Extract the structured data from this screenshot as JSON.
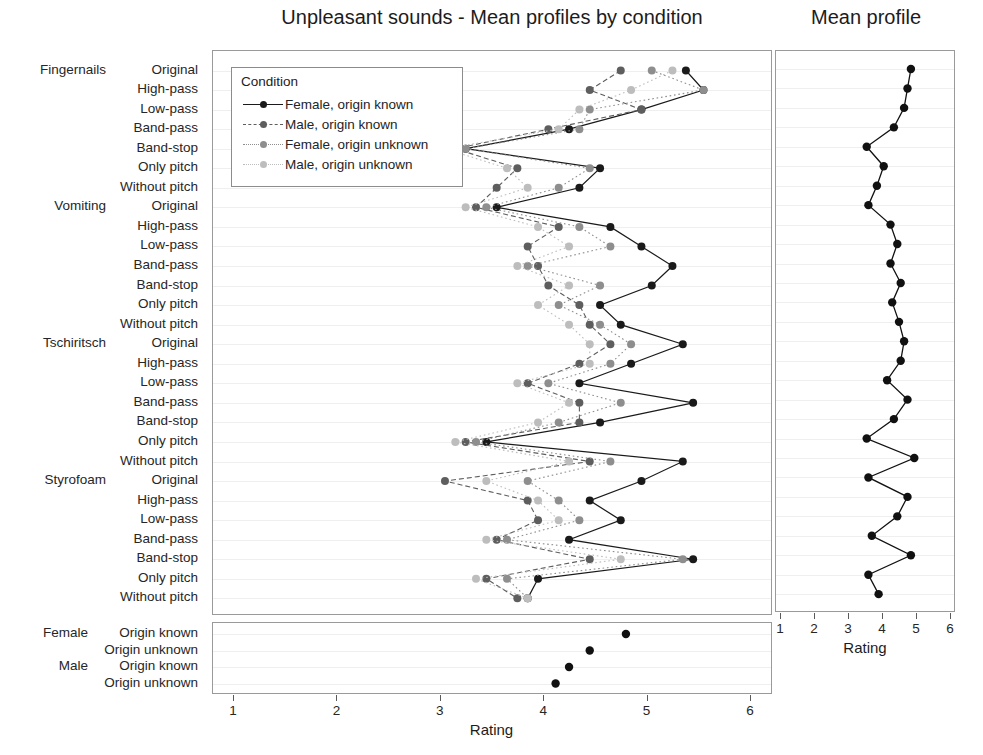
{
  "titles": {
    "main": "Unpleasant sounds - Mean profiles by condition",
    "right": "Mean profile"
  },
  "legend": {
    "title": "Condition",
    "entries": [
      {
        "label": "Female, origin known",
        "color": "#1a1a1a",
        "dash": "solid"
      },
      {
        "label": "Male, origin known",
        "color": "#5e5e5e",
        "dash": "dashed"
      },
      {
        "label": "Female, origin unknown",
        "color": "#8e8e8e",
        "dash": "dotted"
      },
      {
        "label": "Male, origin unknown",
        "color": "#bdbdbd",
        "dash": "dotted"
      }
    ]
  },
  "axis": {
    "xlabel": "Rating",
    "ticks": [
      1,
      2,
      3,
      4,
      5,
      6
    ],
    "xlim": [
      1,
      6
    ]
  },
  "groups": [
    "Fingernails",
    "Vomiting",
    "Tschiritsch",
    "Styrofoam"
  ],
  "filters": [
    "Original",
    "High-pass",
    "Low-pass",
    "Band-pass",
    "Band-stop",
    "Only pitch",
    "Without pitch"
  ],
  "bottom_groups": [
    "Female",
    "Male"
  ],
  "bottom_levels": [
    "Origin known",
    "Origin unknown",
    "Origin known",
    "Origin unknown"
  ],
  "chart_data": {
    "type": "line",
    "title": "Unpleasant sounds - Mean profiles by condition",
    "xlabel": "Rating",
    "ylabel": "",
    "xlim": [
      1,
      6
    ],
    "grid": true,
    "legend_position": "top-left-inside",
    "orientation": "horizontal",
    "categories": [
      "Fingernails / Original",
      "Fingernails / High-pass",
      "Fingernails / Low-pass",
      "Fingernails / Band-pass",
      "Fingernails / Band-stop",
      "Fingernails / Only pitch",
      "Fingernails / Without pitch",
      "Vomiting / Original",
      "Vomiting / High-pass",
      "Vomiting / Low-pass",
      "Vomiting / Band-pass",
      "Vomiting / Band-stop",
      "Vomiting / Only pitch",
      "Vomiting / Without pitch",
      "Tschiritsch / Original",
      "Tschiritsch / High-pass",
      "Tschiritsch / Low-pass",
      "Tschiritsch / Band-pass",
      "Tschiritsch / Band-stop",
      "Tschiritsch / Only pitch",
      "Tschiritsch / Without pitch",
      "Styrofoam / Original",
      "Styrofoam / High-pass",
      "Styrofoam / Low-pass",
      "Styrofoam / Band-pass",
      "Styrofoam / Band-stop",
      "Styrofoam / Only pitch",
      "Styrofoam / Without pitch"
    ],
    "series": [
      {
        "name": "Female, origin known",
        "color": "#1a1a1a",
        "dash": "solid",
        "values": [
          5.38,
          5.55,
          4.95,
          4.25,
          3.25,
          4.55,
          4.35,
          3.55,
          4.65,
          4.95,
          5.25,
          5.05,
          4.55,
          4.75,
          5.35,
          4.85,
          4.35,
          5.45,
          4.55,
          3.45,
          5.35,
          4.95,
          4.45,
          4.75,
          4.25,
          5.45,
          3.95,
          3.85
        ]
      },
      {
        "name": "Male, origin known",
        "color": "#5e5e5e",
        "dash": "dashed",
        "values": [
          4.75,
          4.45,
          4.95,
          4.05,
          3.15,
          3.75,
          3.55,
          3.35,
          4.15,
          3.85,
          3.95,
          4.05,
          4.35,
          4.45,
          4.65,
          4.35,
          3.85,
          4.35,
          4.35,
          3.25,
          4.45,
          3.05,
          3.85,
          3.95,
          3.55,
          4.45,
          3.45,
          3.75
        ]
      },
      {
        "name": "Female, origin unknown",
        "color": "#8e8e8e",
        "dash": "dotted",
        "values": [
          5.05,
          5.55,
          4.45,
          4.35,
          3.25,
          4.45,
          4.15,
          3.45,
          4.35,
          4.65,
          3.85,
          4.55,
          4.15,
          4.55,
          4.85,
          4.65,
          4.05,
          4.75,
          4.15,
          3.35,
          4.65,
          3.85,
          4.15,
          4.35,
          3.65,
          5.35,
          3.65,
          3.85
        ]
      },
      {
        "name": "Male, origin unknown",
        "color": "#bdbdbd",
        "dash": "dotted",
        "values": [
          5.25,
          4.85,
          4.35,
          4.15,
          3.05,
          3.65,
          3.85,
          3.25,
          3.95,
          4.25,
          3.75,
          4.25,
          3.95,
          4.25,
          4.45,
          4.45,
          3.75,
          4.25,
          3.95,
          3.15,
          4.25,
          3.45,
          3.95,
          4.15,
          3.45,
          4.75,
          3.35,
          3.85
        ]
      }
    ],
    "mean_profile": {
      "name": "Mean profile",
      "color": "#111111",
      "dash": "solid",
      "values": [
        4.85,
        4.75,
        4.65,
        4.35,
        3.55,
        4.05,
        3.85,
        3.6,
        4.25,
        4.45,
        4.25,
        4.55,
        4.3,
        4.5,
        4.65,
        4.55,
        4.15,
        4.75,
        4.35,
        3.55,
        4.95,
        3.6,
        4.75,
        4.45,
        3.7,
        4.85,
        3.6,
        3.9
      ]
    },
    "bottom_panel": {
      "categories": [
        "Female / Origin known",
        "Female / Origin unknown",
        "Male / Origin known",
        "Male / Origin unknown"
      ],
      "values": [
        4.8,
        4.45,
        4.25,
        4.12
      ],
      "color": "#111111"
    }
  }
}
